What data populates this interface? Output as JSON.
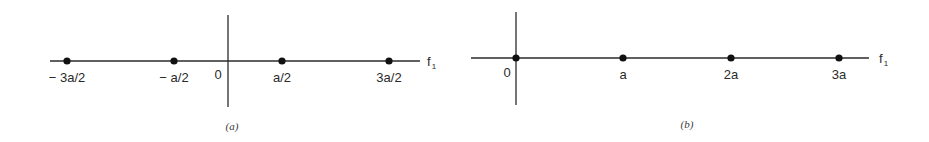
{
  "colors": {
    "background": "#ffffff",
    "axis": "#2b2b2b",
    "dot": "#111111",
    "text": "#2a2a2a"
  },
  "panels": [
    {
      "id": "a",
      "caption": "(a)",
      "axis_label": "f",
      "axis_label_subscript": "1",
      "origin_label": "0",
      "axis": {
        "x1": 50,
        "x2": 420,
        "y": 61
      },
      "vertical": {
        "x": 228,
        "y1": 15,
        "y2": 107
      },
      "origin_label_pos": {
        "x": 218,
        "y": 79
      },
      "axis_label_pos": {
        "x": 427,
        "y": 66
      },
      "caption_pos": {
        "x": 232,
        "y": 130
      },
      "points": [
        {
          "label": "− 3a/2",
          "x": 67,
          "value": "-3a/2"
        },
        {
          "label": "− a/2",
          "x": 174,
          "value": "-a/2"
        },
        {
          "label": "a/2",
          "x": 282,
          "value": "a/2"
        },
        {
          "label": "3a/2",
          "x": 389,
          "value": "3a/2"
        }
      ],
      "label_y": 82
    },
    {
      "id": "b",
      "caption": "(b)",
      "axis_label": "f",
      "axis_label_subscript": "1",
      "origin_label": "0",
      "axis": {
        "x1": 471,
        "x2": 869,
        "y": 58
      },
      "vertical": {
        "x": 516,
        "y1": 12,
        "y2": 105
      },
      "origin_label_pos": {
        "x": 507,
        "y": 77
      },
      "axis_label_pos": {
        "x": 879,
        "y": 63
      },
      "caption_pos": {
        "x": 687,
        "y": 128
      },
      "points": [
        {
          "label": "",
          "x": 516,
          "value": "0"
        },
        {
          "label": "a",
          "x": 623,
          "value": "a"
        },
        {
          "label": "2a",
          "x": 731,
          "value": "2a"
        },
        {
          "label": "3a",
          "x": 839,
          "value": "3a"
        }
      ],
      "label_y": 79
    }
  ]
}
